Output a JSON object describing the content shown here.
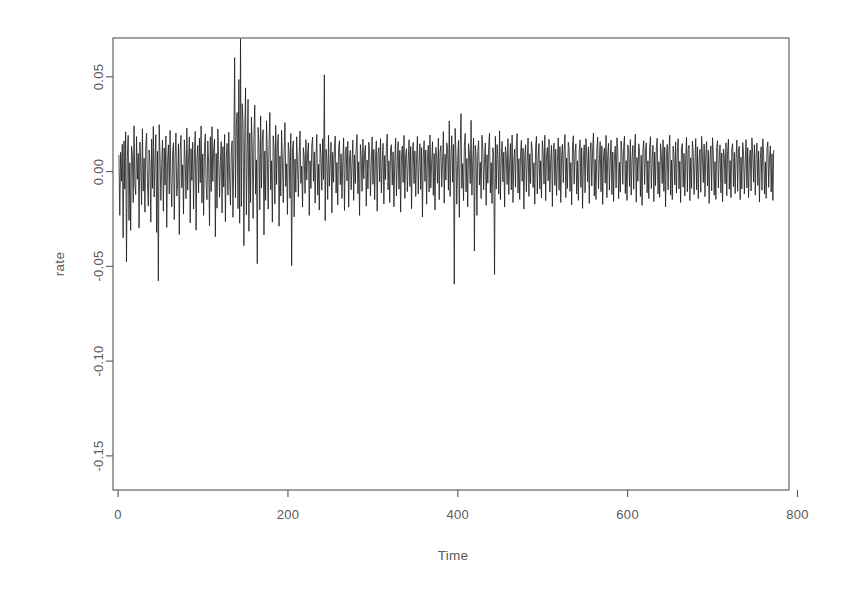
{
  "chart_data": {
    "type": "line",
    "title": "",
    "subtitle": "",
    "xlabel": "Time",
    "ylabel": "rate",
    "grid": false,
    "legend": false,
    "legend_position": "none",
    "line_color": "#1a1a1a",
    "line_width": 0.8,
    "background": "#ffffff",
    "box_border_color": "#555555",
    "xlim": [
      -6,
      790
    ],
    "ylim": [
      -0.168,
      0.0705
    ],
    "xticks": [
      0,
      200,
      400,
      600,
      800
    ],
    "xtick_labels": [
      "0",
      "200",
      "400",
      "600",
      "800"
    ],
    "yticks": [
      0.05,
      0.0,
      -0.05,
      -0.1,
      -0.15
    ],
    "ytick_labels": [
      "0.05",
      "0.00",
      "-0.05",
      "-0.10",
      "-0.15"
    ],
    "n_points": 772,
    "x_start": 1,
    "x_end": 772,
    "series_name": "rate",
    "annotations": [
      {
        "label": "largest drawdown",
        "x": 410,
        "y": -0.159
      },
      {
        "label": "largest gain",
        "x": 141,
        "y": 0.06
      }
    ],
    "summary_stats": {
      "min": -0.159,
      "max": 0.06,
      "mean": 0.0003,
      "sd": 0.0155
    },
    "values": [
      0.0088,
      -0.0231,
      0.0102,
      -0.0051,
      0.0144,
      -0.0349,
      0.0162,
      -0.0092,
      0.021,
      -0.0477,
      0.0073,
      0.0191,
      -0.0258,
      0.0046,
      -0.031,
      0.0134,
      0.0088,
      -0.0163,
      0.0242,
      -0.0066,
      -0.0121,
      0.0185,
      -0.004,
      0.0096,
      -0.0298,
      0.0156,
      0.0029,
      -0.0175,
      0.0226,
      -0.0103,
      0.0071,
      -0.0214,
      0.0138,
      0.0203,
      -0.0059,
      -0.0182,
      0.0114,
      0.0046,
      -0.0267,
      0.0172,
      -0.0088,
      0.0239,
      -0.0134,
      0.0061,
      0.0195,
      -0.0321,
      0.0107,
      -0.0576,
      0.0248,
      0.0083,
      -0.0152,
      0.0037,
      0.0166,
      -0.0209,
      0.0125,
      -0.0071,
      0.0188,
      -0.0294,
      0.0054,
      0.0141,
      -0.0118,
      0.0217,
      -0.0043,
      -0.0186,
      0.0099,
      0.0152,
      -0.0253,
      0.0078,
      0.0204,
      -0.0129,
      -0.0061,
      0.0147,
      -0.0332,
      0.0113,
      0.0191,
      -0.0085,
      0.0036,
      -0.0224,
      0.0168,
      0.0057,
      -0.0143,
      0.0229,
      -0.0098,
      0.0074,
      0.0183,
      -0.0271,
      0.0121,
      -0.0046,
      0.0155,
      -0.0197,
      0.0088,
      0.0212,
      -0.0309,
      0.0065,
      0.0138,
      -0.0112,
      0.0176,
      -0.0058,
      0.0241,
      -0.0165,
      0.0093,
      -0.0231,
      0.0127,
      0.0199,
      -0.0074,
      -0.0148,
      0.0162,
      0.0041,
      -0.0286,
      0.0184,
      -0.0105,
      0.0237,
      -0.0052,
      0.0118,
      0.0171,
      -0.0343,
      0.0096,
      -0.0193,
      0.0225,
      0.0063,
      -0.0136,
      0.0049,
      0.0158,
      -0.0218,
      0.0132,
      -0.0081,
      0.0196,
      -0.0264,
      0.0067,
      0.0149,
      -0.0124,
      0.0208,
      -0.0035,
      -0.0177,
      0.0104,
      0.0163,
      -0.0241,
      0.0087,
      0.0602,
      -0.0138,
      0.0251,
      0.0312,
      -0.0195,
      0.0486,
      -0.0272,
      0.0701,
      -0.0184,
      0.0358,
      0.0266,
      -0.0391,
      0.0173,
      0.0442,
      -0.0228,
      0.0095,
      0.0381,
      -0.0315,
      0.0204,
      -0.0163,
      0.0288,
      0.0132,
      -0.0247,
      0.0176,
      0.0351,
      -0.0119,
      0.0062,
      -0.0486,
      0.0233,
      0.0148,
      -0.0201,
      0.0294,
      -0.0087,
      0.0165,
      0.0221,
      -0.0334,
      0.0109,
      -0.0152,
      0.0268,
      0.0074,
      -0.0198,
      0.0143,
      0.0312,
      -0.0096,
      0.0057,
      -0.0267,
      0.0189,
      0.0126,
      -0.0171,
      0.0243,
      -0.0068,
      0.0134,
      0.0196,
      -0.0288,
      0.0083,
      -0.0129,
      0.0217,
      0.0051,
      -0.0164,
      0.0112,
      0.0258,
      -0.0078,
      0.0041,
      -0.0226,
      0.0153,
      0.0098,
      -0.0141,
      0.0201,
      -0.0496,
      0.0109,
      0.0162,
      -0.0239,
      0.0066,
      -0.0108,
      0.0184,
      0.0037,
      -0.0133,
      0.0091,
      0.0214,
      -0.0062,
      0.0029,
      -0.0187,
      0.0126,
      0.0078,
      -0.0115,
      0.0168,
      -0.0044,
      0.0093,
      0.0152,
      -0.0231,
      0.0057,
      -0.0089,
      0.0139,
      0.0182,
      -0.0051,
      0.0104,
      -0.0166,
      0.0071,
      0.0196,
      -0.0124,
      0.0038,
      -0.0203,
      0.0147,
      0.0085,
      -0.0098,
      0.0173,
      -0.0042,
      0.0511,
      -0.0259,
      0.0118,
      0.0064,
      -0.0147,
      0.0192,
      -0.0077,
      0.0036,
      0.0155,
      -0.0218,
      0.0102,
      -0.0056,
      0.0134,
      0.0187,
      -0.0113,
      0.0048,
      -0.0176,
      0.0121,
      0.0163,
      -0.0069,
      0.0094,
      -0.0142,
      0.0055,
      0.0178,
      -0.0205,
      0.0086,
      0.0131,
      -0.0049,
      0.0159,
      -0.0188,
      0.0073,
      0.0112,
      -0.0096,
      0.0041,
      0.0166,
      -0.0152,
      0.0088,
      -0.0063,
      0.0124,
      0.0195,
      -0.0117,
      0.0052,
      -0.0231,
      0.0143,
      0.0079,
      -0.0104,
      0.0171,
      -0.0038,
      0.0096,
      0.0138,
      -0.0182,
      0.0061,
      -0.0091,
      0.0155,
      0.0108,
      -0.0129,
      0.0046,
      0.0183,
      -0.0067,
      0.0117,
      -0.0148,
      0.0074,
      0.0162,
      -0.0209,
      0.0093,
      0.0126,
      -0.0054,
      0.0174,
      -0.0113,
      0.0038,
      0.0149,
      -0.0171,
      0.0085,
      -0.0042,
      0.0131,
      0.0198,
      -0.0096,
      0.0057,
      -0.0163,
      0.0119,
      0.0142,
      -0.0071,
      0.0104,
      -0.0186,
      0.0063,
      0.0177,
      -0.0128,
      0.0049,
      0.0158,
      -0.0093,
      0.0112,
      -0.0214,
      0.0076,
      0.0135,
      -0.0058,
      0.0191,
      -0.0142,
      0.0088,
      0.0121,
      -0.0106,
      0.0047,
      0.0168,
      -0.0079,
      0.0133,
      -0.0196,
      0.0092,
      0.0154,
      -0.0063,
      0.0109,
      -0.0131,
      0.0071,
      0.0186,
      -0.0118,
      0.0044,
      0.0147,
      -0.0094,
      0.0126,
      -0.0239,
      0.0081,
      0.0163,
      -0.0052,
      0.0114,
      -0.0172,
      0.0068,
      0.0139,
      -0.0107,
      0.0193,
      -0.0086,
      0.0051,
      0.0158,
      -0.0125,
      0.0096,
      -0.0203,
      0.0128,
      0.0073,
      -0.0061,
      0.0176,
      -0.0148,
      0.0103,
      0.0137,
      -0.0082,
      0.0059,
      0.0211,
      -0.0166,
      0.0091,
      -0.0045,
      0.0152,
      0.0118,
      -0.0098,
      0.0267,
      -0.0131,
      0.0074,
      0.0189,
      -0.0056,
      0.0143,
      -0.0594,
      0.0228,
      0.0096,
      -0.0172,
      0.0058,
      0.0164,
      -0.0241,
      0.0117,
      0.0306,
      -0.0088,
      0.0042,
      -0.0153,
      0.0133,
      0.0201,
      -0.0107,
      0.0069,
      -0.0186,
      0.0148,
      0.0092,
      -0.0063,
      0.0271,
      -0.0124,
      0.0053,
      0.0177,
      -0.0419,
      0.0138,
      0.0084,
      -0.0231,
      0.0106,
      0.0163,
      -0.0071,
      0.0049,
      -0.0142,
      0.0192,
      0.0118,
      -0.0097,
      0.0056,
      0.0151,
      -0.0178,
      0.0089,
      -0.0061,
      0.0134,
      0.0203,
      -0.0113,
      0.0047,
      -0.0168,
      0.0126,
      0.0081,
      -0.0542,
      0.0186,
      -0.0092,
      0.0143,
      0.0065,
      -0.0119,
      0.0215,
      -0.0148,
      0.0073,
      0.0159,
      -0.0054,
      0.0102,
      -0.0187,
      0.0131,
      0.0086,
      -0.0068,
      0.0174,
      -0.0121,
      0.0044,
      0.0148,
      -0.0096,
      0.0193,
      -0.0163,
      0.0057,
      0.0119,
      -0.0082,
      0.0136,
      0.0201,
      -0.0113,
      0.0068,
      -0.0147,
      0.0091,
      0.0165,
      -0.0051,
      0.0124,
      -0.0198,
      0.0079,
      0.0142,
      -0.0106,
      0.0053,
      0.0177,
      -0.0131,
      0.0094,
      -0.0063,
      0.0158,
      0.0112,
      -0.0084,
      0.0046,
      -0.0172,
      0.0129,
      0.0186,
      -0.0118,
      0.0071,
      0.0148,
      -0.0092,
      0.0057,
      -0.0139,
      0.0163,
      0.0104,
      -0.0066,
      0.0192,
      -0.0153,
      0.0083,
      0.0127,
      -0.0049,
      0.0171,
      -0.0108,
      0.0062,
      0.0139,
      -0.0184,
      0.0096,
      0.0151,
      -0.0073,
      0.0118,
      -0.0126,
      0.0054,
      0.0178,
      -0.0098,
      0.0132,
      -0.0163,
      0.0086,
      0.0144,
      -0.0058,
      0.0109,
      0.0196,
      -0.0137,
      0.0072,
      -0.0089,
      0.0155,
      0.0121,
      -0.0104,
      0.0048,
      -0.0176,
      0.0133,
      0.0189,
      -0.0066,
      0.0094,
      0.0147,
      -0.0118,
      0.0057,
      -0.0152,
      0.0106,
      0.0168,
      -0.0083,
      0.0126,
      -0.0194,
      0.0061,
      0.0141,
      -0.0112,
      0.0174,
      0.0089,
      -0.0053,
      0.0131,
      -0.0168,
      0.0097,
      0.0153,
      -0.0076,
      0.0114,
      0.0203,
      -0.0129,
      0.0064,
      -0.0147,
      0.0119,
      0.0182,
      -0.0091,
      0.0051,
      0.0158,
      -0.0106,
      0.0136,
      -0.0173,
      0.0078,
      0.0124,
      -0.0061,
      0.0191,
      -0.0138,
      0.0087,
      0.0149,
      -0.0098,
      0.0056,
      0.0166,
      -0.0121,
      0.0103,
      -0.0157,
      0.0072,
      0.0134,
      -0.0086,
      0.0178,
      0.0112,
      -0.0143,
      0.0049,
      -0.0108,
      0.0161,
      0.0093,
      -0.0067,
      0.0129,
      0.0187,
      -0.0116,
      0.0058,
      -0.0152,
      0.0141,
      0.0104,
      -0.0078,
      0.0169,
      -0.0124,
      0.0063,
      0.0138,
      -0.0093,
      0.0116,
      0.0198,
      -0.0161,
      0.0074,
      -0.0051,
      0.0147,
      0.0109,
      -0.0131,
      0.0086,
      -0.0178,
      0.0122,
      0.0163,
      -0.0068,
      0.0098,
      0.0152,
      -0.0112,
      0.0057,
      -0.0143,
      0.0128,
      0.0184,
      -0.0089,
      0.0066,
      0.0139,
      -0.0159,
      0.0103,
      -0.0074,
      0.0121,
      0.0176,
      -0.0118,
      0.0052,
      -0.0136,
      0.0147,
      0.0091,
      -0.0063,
      0.0168,
      -0.0104,
      0.0129,
      -0.0186,
      0.0078,
      0.0143,
      -0.0096,
      0.0112,
      0.0192,
      -0.0124,
      0.0061,
      -0.0148,
      0.0134,
      0.0086,
      -0.0071,
      0.0157,
      -0.0113,
      0.0102,
      0.0173,
      -0.0091,
      0.0054,
      -0.0163,
      0.0126,
      0.0148,
      -0.0082,
      0.0096,
      -0.0129,
      0.0068,
      0.0181,
      -0.0106,
      0.0117,
      0.0139,
      -0.0153,
      0.0073,
      -0.0088,
      0.0161,
      0.0104,
      -0.0121,
      0.0049,
      0.0174,
      -0.0096,
      0.0131,
      -0.0142,
      0.0062,
      0.0118,
      -0.0109,
      0.0186,
      0.0083,
      -0.0058,
      0.0146,
      -0.0132,
      0.0094,
      0.0158,
      -0.0076,
      0.0113,
      -0.0168,
      0.0067,
      0.0136,
      -0.0101,
      0.0179,
      0.0089,
      -0.0124,
      0.0053,
      -0.0147,
      0.0128,
      0.0163,
      -0.0086,
      0.0072,
      0.0141,
      -0.0112,
      0.0098,
      -0.0159,
      0.0119,
      0.0084,
      -0.0064,
      0.0152,
      -0.0127,
      0.0106,
      0.0171,
      -0.0093,
      0.0058,
      -0.0138,
      0.0124,
      0.0147,
      -0.0079,
      0.0102,
      -0.0116,
      0.0068,
      0.0166,
      -0.0104,
      0.0121,
      0.0134,
      -0.0148,
      0.0076,
      -0.0091,
      0.0153,
      0.0098,
      -0.0118,
      0.0052,
      0.0169,
      -0.0086,
      0.0126,
      -0.0137,
      0.0063,
      0.0114,
      -0.0102,
      0.0178,
      0.0081,
      -0.0056,
      0.0142,
      -0.0124,
      0.0091,
      0.0151,
      -0.0073,
      0.0108,
      -0.0161,
      0.0064,
      0.0131,
      -0.0098,
      0.0173,
      0.0086,
      -0.0118,
      0.0051,
      -0.0141,
      0.0124,
      0.0157,
      -0.0083,
      0.0069,
      0.0136,
      -0.0108,
      0.0094,
      -0.0152,
      0.0114
    ]
  }
}
